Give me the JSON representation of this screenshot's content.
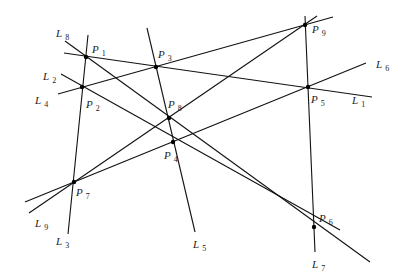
{
  "diagram": {
    "type": "line-point incidence configuration",
    "lines": [
      {
        "id": "L1",
        "name": "L",
        "sub": "1",
        "from": [
          64,
          53
        ],
        "to": [
          372,
          97
        ],
        "label_pos": [
          352,
          104
        ],
        "points": [
          "P1",
          "P3",
          "P5"
        ]
      },
      {
        "id": "L2",
        "name": "L",
        "sub": "2",
        "from": [
          61,
          74
        ],
        "to": [
          340,
          230
        ],
        "label_pos": [
          43,
          80
        ],
        "points": [
          "P2",
          "P4",
          "P6"
        ]
      },
      {
        "id": "L3",
        "name": "L",
        "sub": "3",
        "from": [
          88,
          35
        ],
        "to": [
          68,
          234
        ],
        "label_pos": [
          56,
          245
        ],
        "points": [
          "P1",
          "P2",
          "P7"
        ]
      },
      {
        "id": "L4",
        "name": "L",
        "sub": "4",
        "from": [
          58,
          94
        ],
        "to": [
          333,
          17
        ],
        "label_pos": [
          35,
          104
        ],
        "points": [
          "P2",
          "P3",
          "P9"
        ]
      },
      {
        "id": "L5",
        "name": "L",
        "sub": "5",
        "from": [
          147,
          28
        ],
        "to": [
          195,
          232
        ],
        "label_pos": [
          193,
          248
        ],
        "points": [
          "P3",
          "P8",
          "P4"
        ]
      },
      {
        "id": "L6",
        "name": "L",
        "sub": "6",
        "from": [
          25,
          202
        ],
        "to": [
          366,
          63
        ],
        "label_pos": [
          376,
          68
        ],
        "points": [
          "P7",
          "P4",
          "P5"
        ]
      },
      {
        "id": "L7",
        "name": "L",
        "sub": "7",
        "from": [
          305,
          16
        ],
        "to": [
          315,
          252
        ],
        "label_pos": [
          312,
          268
        ],
        "points": [
          "P9",
          "P5",
          "P6"
        ]
      },
      {
        "id": "L8",
        "name": "L",
        "sub": "8",
        "from": [
          65,
          41
        ],
        "to": [
          370,
          262
        ],
        "label_pos": [
          56,
          37
        ],
        "points": [
          "P1",
          "P8",
          "P6"
        ]
      },
      {
        "id": "L9",
        "name": "L",
        "sub": "9",
        "from": [
          29,
          213
        ],
        "to": [
          317,
          16
        ],
        "label_pos": [
          35,
          227
        ],
        "points": [
          "P7",
          "P8",
          "P9"
        ]
      }
    ],
    "points": [
      {
        "id": "P1",
        "name": "P",
        "sub": "1",
        "at": [
          86,
          57
        ],
        "label_pos": [
          92,
          53
        ]
      },
      {
        "id": "P2",
        "name": "P",
        "sub": "2",
        "at": [
          82,
          87
        ],
        "label_pos": [
          86,
          108
        ]
      },
      {
        "id": "P3",
        "name": "P",
        "sub": "3",
        "at": [
          156,
          67
        ],
        "label_pos": [
          158,
          58
        ]
      },
      {
        "id": "P4",
        "name": "P",
        "sub": "4",
        "at": [
          173,
          142
        ],
        "label_pos": [
          164,
          159
        ]
      },
      {
        "id": "P5",
        "name": "P",
        "sub": "5",
        "at": [
          308,
          87
        ],
        "label_pos": [
          311,
          103
        ]
      },
      {
        "id": "P6",
        "name": "P",
        "sub": "6",
        "at": [
          314,
          227
        ],
        "label_pos": [
          319,
          222
        ]
      },
      {
        "id": "P7",
        "name": "P",
        "sub": "7",
        "at": [
          74,
          182
        ],
        "label_pos": [
          76,
          196
        ]
      },
      {
        "id": "P8",
        "name": "P",
        "sub": "8",
        "at": [
          169,
          118
        ],
        "label_pos": [
          168,
          108
        ]
      },
      {
        "id": "P9",
        "name": "P",
        "sub": "9",
        "at": [
          305,
          25
        ],
        "label_pos": [
          312,
          33
        ]
      }
    ]
  }
}
